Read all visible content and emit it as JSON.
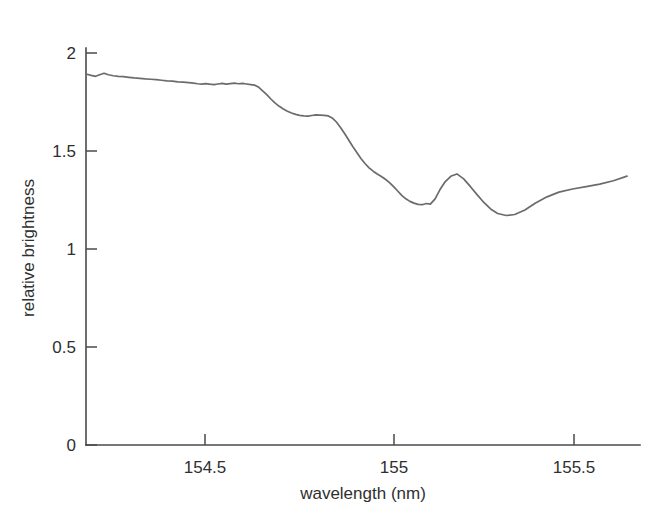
{
  "chart_data": {
    "type": "line",
    "title": "",
    "subtitle": "",
    "xlabel": "wavelength (nm)",
    "ylabel": "relative brightness",
    "xlim": [
      154.19,
      155.78
    ],
    "ylim": [
      0,
      2.0
    ],
    "xticks": [
      154.5,
      155,
      155.5
    ],
    "xtick_labels": [
      "154.5",
      "155",
      "155.5"
    ],
    "yticks": [
      0,
      0.5,
      1,
      1.5,
      2
    ],
    "ytick_labels": [
      "0",
      "0.5",
      "1",
      "1.5",
      "2"
    ],
    "grid": false,
    "legend": "none",
    "line_color": "#6b6b6b",
    "axis_color": "#4a4a4a",
    "series": [
      {
        "name": "spectrum",
        "x": [
          154.19,
          154.205,
          154.218,
          154.23,
          154.243,
          154.256,
          154.27,
          154.285,
          154.3,
          154.316,
          154.332,
          154.348,
          154.364,
          154.38,
          154.396,
          154.412,
          154.428,
          154.444,
          154.46,
          154.476,
          154.492,
          154.506,
          154.518,
          154.53,
          154.542,
          154.554,
          154.566,
          154.578,
          154.59,
          154.602,
          154.614,
          154.626,
          154.638,
          154.65,
          154.662,
          154.674,
          154.686,
          154.698,
          154.71,
          154.722,
          154.734,
          154.746,
          154.758,
          154.77,
          154.782,
          154.794,
          154.806,
          154.818,
          154.83,
          154.842,
          154.854,
          154.866,
          154.878,
          154.89,
          154.902,
          154.914,
          154.926,
          154.938,
          154.95,
          154.962,
          154.974,
          154.986,
          154.998,
          155.01,
          155.022,
          155.034,
          155.046,
          155.058,
          155.07,
          155.082,
          155.094,
          155.106,
          155.118,
          155.13,
          155.142,
          155.154,
          155.166,
          155.178,
          155.19,
          155.202,
          155.216,
          155.23,
          155.246,
          155.262,
          155.28,
          155.3,
          155.32,
          155.34,
          155.36,
          155.38,
          155.4,
          155.425,
          155.45,
          155.48,
          155.51,
          155.545,
          155.58,
          155.62,
          155.66,
          155.7,
          155.74,
          155.78
        ],
        "y": [
          1.893,
          1.886,
          1.881,
          1.889,
          1.897,
          1.889,
          1.884,
          1.881,
          1.879,
          1.876,
          1.873,
          1.871,
          1.868,
          1.866,
          1.864,
          1.861,
          1.858,
          1.856,
          1.853,
          1.851,
          1.849,
          1.846,
          1.843,
          1.841,
          1.844,
          1.841,
          1.839,
          1.842,
          1.845,
          1.841,
          1.844,
          1.846,
          1.843,
          1.845,
          1.842,
          1.839,
          1.836,
          1.825,
          1.806,
          1.786,
          1.764,
          1.744,
          1.728,
          1.714,
          1.703,
          1.694,
          1.687,
          1.682,
          1.679,
          1.678,
          1.681,
          1.684,
          1.683,
          1.682,
          1.679,
          1.668,
          1.648,
          1.62,
          1.589,
          1.556,
          1.523,
          1.492,
          1.462,
          1.436,
          1.414,
          1.397,
          1.383,
          1.37,
          1.356,
          1.339,
          1.318,
          1.296,
          1.274,
          1.256,
          1.243,
          1.234,
          1.228,
          1.226,
          1.232,
          1.229,
          1.256,
          1.302,
          1.344,
          1.371,
          1.383,
          1.358,
          1.318,
          1.276,
          1.236,
          1.203,
          1.181,
          1.171,
          1.176,
          1.199,
          1.233,
          1.266,
          1.29,
          1.306,
          1.318,
          1.331,
          1.348,
          1.372
        ],
        "y_note": "continues in series_tail"
      }
    ],
    "series_tail": {
      "x": [
        155.8,
        155.83,
        155.86,
        155.89,
        155.92,
        155.95,
        155.98,
        156.01,
        156.04,
        156.07,
        156.1
      ],
      "y": [
        1.39,
        1.41,
        1.43,
        1.452,
        1.47,
        1.48,
        1.486,
        1.492,
        1.5,
        1.51,
        1.52
      ]
    },
    "annotations": []
  },
  "figure": {
    "caption": ""
  }
}
